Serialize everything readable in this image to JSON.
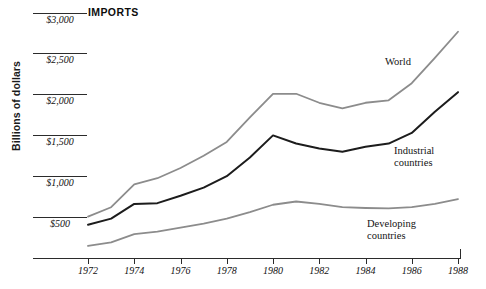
{
  "chart_data": {
    "type": "line",
    "title": "IMPORTS",
    "xlabel": "",
    "ylabel": "Billions of dollars",
    "x": [
      1972,
      1973,
      1974,
      1975,
      1976,
      1977,
      1978,
      1979,
      1980,
      1981,
      1982,
      1983,
      1984,
      1985,
      1986,
      1987,
      1988
    ],
    "xticks": [
      "1972",
      "1974",
      "1976",
      "1978",
      "1980",
      "1982",
      "1984",
      "1986",
      "1988"
    ],
    "yticks": [
      "$500",
      "$1,000",
      "$1,500",
      "$2,000",
      "$2,500",
      "$3,000"
    ],
    "ylim": [
      0,
      3000
    ],
    "xlim": [
      1972,
      1988
    ],
    "grid": "horizontal-rules-at-yticks",
    "legend": "inline-series-labels",
    "series": [
      {
        "name": "World",
        "color": "#8c8c8c",
        "label_text": "World",
        "values": [
          505,
          620,
          900,
          975,
          1100,
          1250,
          1420,
          1720,
          2010,
          2010,
          1900,
          1830,
          1900,
          1930,
          2140,
          2450,
          2770
        ]
      },
      {
        "name": "Industrial countries",
        "color": "#1c1c1c",
        "label_text": "Industrial\ncountries",
        "values": [
          405,
          480,
          660,
          670,
          760,
          860,
          1000,
          1230,
          1500,
          1400,
          1340,
          1300,
          1360,
          1400,
          1530,
          1790,
          2030
        ]
      },
      {
        "name": "Developing countries",
        "color": "#8c8c8c",
        "label_text": "Developing\ncountries",
        "values": [
          145,
          190,
          290,
          320,
          370,
          420,
          480,
          560,
          650,
          690,
          660,
          620,
          610,
          605,
          620,
          660,
          720
        ]
      }
    ]
  },
  "labels": {
    "world": "World",
    "industrial_line1": "Industrial",
    "industrial_line2": "countries",
    "developing_line1": "Developing",
    "developing_line2": "countries"
  }
}
